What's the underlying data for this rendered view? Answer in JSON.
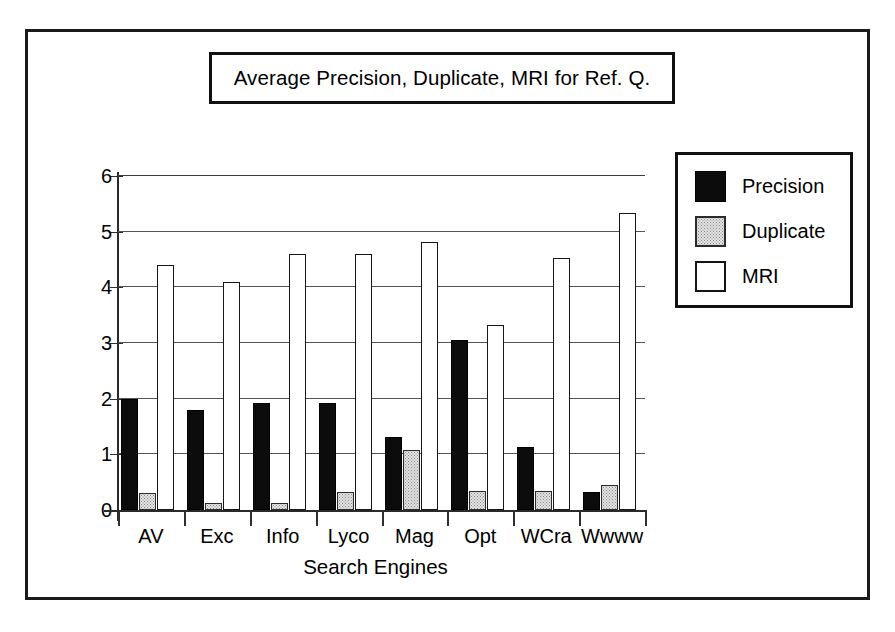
{
  "chart_data": {
    "type": "bar",
    "title": "Average Precision, Duplicate, MRI for Ref. Q.",
    "xlabel": "Search Engines",
    "ylabel": "",
    "categories": [
      "AV",
      "Exc",
      "Info",
      "Lyco",
      "Mag",
      "Opt",
      "WCra",
      "Wwww"
    ],
    "series": [
      {
        "name": "Precision",
        "color": "#0c0c0c",
        "values": [
          2.0,
          1.8,
          1.92,
          1.93,
          1.32,
          3.05,
          1.13,
          0.33
        ]
      },
      {
        "name": "Duplicate",
        "color": "#e3e3e3",
        "values": [
          0.3,
          0.12,
          0.12,
          0.33,
          1.08,
          0.34,
          0.34,
          0.45
        ]
      },
      {
        "name": "MRI",
        "color": "#ffffff",
        "values": [
          4.4,
          4.1,
          4.6,
          4.6,
          4.82,
          3.33,
          4.53,
          5.33
        ]
      }
    ],
    "ylim": [
      0,
      6
    ],
    "yticks": [
      0,
      1,
      2,
      3,
      4,
      5,
      6
    ],
    "ytick_labels": [
      "0",
      "1",
      "2",
      "3",
      "4",
      "5",
      "6"
    ],
    "grid": true,
    "legend_position": "right"
  },
  "legend": {
    "entries": [
      {
        "label": "Precision",
        "swatch": "precision"
      },
      {
        "label": "Duplicate",
        "swatch": "duplicate"
      },
      {
        "label": "MRI",
        "swatch": "mri"
      }
    ]
  }
}
